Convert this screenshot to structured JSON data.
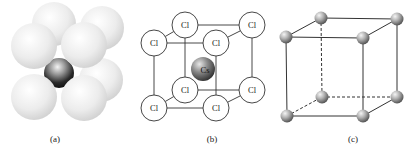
{
  "figure": {
    "panels": [
      {
        "id": "a",
        "label": "(a)",
        "description": "space-filling model of CsCl unit cell"
      },
      {
        "id": "b",
        "label": "(b)",
        "description": "ball-and-stick CsCl cell",
        "corner_atom": "Cl",
        "center_atom": "Cs",
        "corner_labels": [
          "Cl",
          "Cl",
          "Cl",
          "Cl",
          "Cl",
          "Cl",
          "Cl",
          "Cl"
        ]
      },
      {
        "id": "c",
        "label": "(c)",
        "description": "simple cubic lattice"
      }
    ]
  },
  "colors": {
    "line": "#333333",
    "sphere_light": "#f2f2f2",
    "sphere_shadow": "#c8c8c8",
    "cs_dark": "#2a2a2a",
    "ball_grey": "#8a8a8a"
  }
}
